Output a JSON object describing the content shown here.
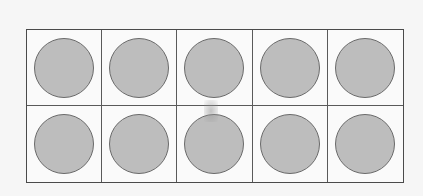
{
  "ten_frame": {
    "rows": 2,
    "columns": 5,
    "total_cells": 10,
    "filled_count": 10,
    "counter_color": "#bdbdbd",
    "border_color": "#4a4a4a",
    "cells": [
      {
        "filled": true
      },
      {
        "filled": true
      },
      {
        "filled": true
      },
      {
        "filled": true
      },
      {
        "filled": true
      },
      {
        "filled": true
      },
      {
        "filled": true
      },
      {
        "filled": true
      },
      {
        "filled": true
      },
      {
        "filled": true
      }
    ]
  }
}
